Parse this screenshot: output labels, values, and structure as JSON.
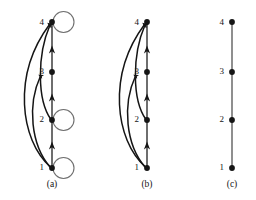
{
  "figure": {
    "kind": "graph-diagram",
    "background_color": "#ffffff",
    "ink_color": "#151515",
    "spine_color": "#4a4a4a",
    "loop_color": "#6f6f6f",
    "width": 256,
    "height": 200
  },
  "vertex_labels": [
    "1",
    "2",
    "3",
    "4"
  ],
  "vertex_y": [
    168,
    120,
    72,
    22
  ],
  "panels": [
    {
      "id": "a",
      "caption": "(a)",
      "caption_x": 52,
      "caption_y": 185,
      "spine_x": 52,
      "has_self_loops": true,
      "self_loop_vertices": [
        "1",
        "2",
        "4"
      ],
      "spine_arrow_vertices": [
        "2",
        "3",
        "4"
      ],
      "arc_edges": [
        "1-4",
        "1-3",
        "2-4"
      ],
      "labels": [
        {
          "text": "4",
          "x": 38,
          "y": 18
        },
        {
          "text": "3",
          "x": 38,
          "y": 67
        },
        {
          "text": "2",
          "x": 38,
          "y": 115
        },
        {
          "text": "1",
          "x": 38,
          "y": 164
        }
      ]
    },
    {
      "id": "b",
      "caption": "(b)",
      "caption_x": 147,
      "caption_y": 185,
      "spine_x": 147,
      "has_self_loops": false,
      "self_loop_vertices": [],
      "spine_arrow_vertices": [
        "2",
        "3",
        "4"
      ],
      "arc_edges": [
        "1-4",
        "1-3",
        "2-4"
      ],
      "labels": [
        {
          "text": "4",
          "x": 133,
          "y": 18
        },
        {
          "text": "3",
          "x": 133,
          "y": 67
        },
        {
          "text": "2",
          "x": 133,
          "y": 115
        },
        {
          "text": "1",
          "x": 133,
          "y": 164
        }
      ]
    },
    {
      "id": "c",
      "caption": "(c)",
      "caption_x": 232,
      "caption_y": 185,
      "spine_x": 232,
      "has_self_loops": false,
      "self_loop_vertices": [],
      "spine_arrow_vertices": [],
      "arc_edges": [],
      "labels": [
        {
          "text": "4",
          "x": 218,
          "y": 18
        },
        {
          "text": "3",
          "x": 218,
          "y": 67
        },
        {
          "text": "2",
          "x": 218,
          "y": 115
        },
        {
          "text": "1",
          "x": 218,
          "y": 164
        }
      ]
    }
  ]
}
